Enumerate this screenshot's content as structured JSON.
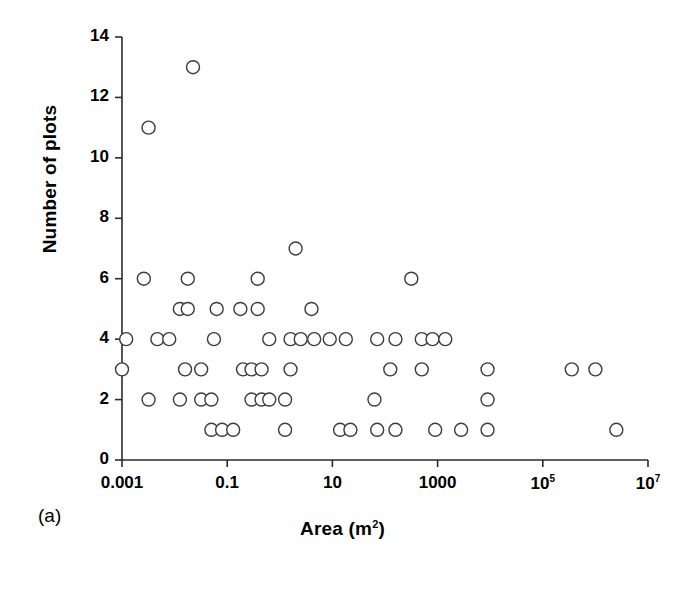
{
  "panel": {
    "caption": "(a)"
  },
  "chart_data": {
    "type": "scatter",
    "title": "",
    "xlabel": "Area (m²)",
    "xlabel_base": "Area (m",
    "xlabel_sup": "2",
    "xlabel_tail": ")",
    "ylabel": "Number of plots",
    "xscale": "log",
    "yscale": "linear",
    "xlim": [
      0.001,
      10000000
    ],
    "ylim": [
      0,
      14
    ],
    "grid": false,
    "legend": null,
    "marker": {
      "shape": "circle",
      "facecolor": "#ffffff",
      "edgecolor": "#3c3c3c",
      "size_px": 13,
      "linewidth_px": 1.4
    },
    "xticks": [
      {
        "value": 0.001,
        "label": "0.001",
        "sup": ""
      },
      {
        "value": 0.1,
        "label": "0.1",
        "sup": ""
      },
      {
        "value": 10,
        "label": "10",
        "sup": ""
      },
      {
        "value": 1000,
        "label": "1000",
        "sup": ""
      },
      {
        "value": 100000,
        "label": "10",
        "sup": "5"
      },
      {
        "value": 10000000,
        "label": "10",
        "sup": "7"
      }
    ],
    "yticks": [
      {
        "value": 0,
        "label": "0"
      },
      {
        "value": 2,
        "label": "2"
      },
      {
        "value": 4,
        "label": "4"
      },
      {
        "value": 6,
        "label": "6"
      },
      {
        "value": 8,
        "label": "8"
      },
      {
        "value": 10,
        "label": "10"
      },
      {
        "value": 12,
        "label": "12"
      },
      {
        "value": 14,
        "label": "14"
      }
    ],
    "points": [
      {
        "x": 0.0224,
        "y": 13
      },
      {
        "x": 0.0032,
        "y": 11
      },
      {
        "x": 2.0,
        "y": 7
      },
      {
        "x": 0.0026,
        "y": 6
      },
      {
        "x": 0.0178,
        "y": 6
      },
      {
        "x": 0.38,
        "y": 6
      },
      {
        "x": 316.0,
        "y": 6
      },
      {
        "x": 0.0126,
        "y": 5
      },
      {
        "x": 0.0178,
        "y": 5
      },
      {
        "x": 0.063,
        "y": 5
      },
      {
        "x": 0.178,
        "y": 5
      },
      {
        "x": 0.38,
        "y": 5
      },
      {
        "x": 4.0,
        "y": 5
      },
      {
        "x": 0.0012,
        "y": 4
      },
      {
        "x": 0.0047,
        "y": 4
      },
      {
        "x": 0.0079,
        "y": 4
      },
      {
        "x": 0.056,
        "y": 4
      },
      {
        "x": 0.63,
        "y": 4
      },
      {
        "x": 1.6,
        "y": 4
      },
      {
        "x": 2.5,
        "y": 4
      },
      {
        "x": 4.5,
        "y": 4
      },
      {
        "x": 8.9,
        "y": 4
      },
      {
        "x": 18.0,
        "y": 4
      },
      {
        "x": 71.0,
        "y": 4
      },
      {
        "x": 158.0,
        "y": 4
      },
      {
        "x": 500.0,
        "y": 4
      },
      {
        "x": 800.0,
        "y": 4
      },
      {
        "x": 1400.0,
        "y": 4
      },
      {
        "x": 0.001,
        "y": 3
      },
      {
        "x": 0.0158,
        "y": 3
      },
      {
        "x": 0.032,
        "y": 3
      },
      {
        "x": 0.2,
        "y": 3
      },
      {
        "x": 0.29,
        "y": 3
      },
      {
        "x": 0.45,
        "y": 3
      },
      {
        "x": 1.6,
        "y": 3
      },
      {
        "x": 126.0,
        "y": 3
      },
      {
        "x": 500.0,
        "y": 3
      },
      {
        "x": 8900.0,
        "y": 3
      },
      {
        "x": 355000.0,
        "y": 3
      },
      {
        "x": 1000000.0,
        "y": 3
      },
      {
        "x": 0.0032,
        "y": 2
      },
      {
        "x": 0.0126,
        "y": 2
      },
      {
        "x": 0.032,
        "y": 2
      },
      {
        "x": 0.05,
        "y": 2
      },
      {
        "x": 0.29,
        "y": 2
      },
      {
        "x": 0.45,
        "y": 2
      },
      {
        "x": 0.63,
        "y": 2
      },
      {
        "x": 1.26,
        "y": 2
      },
      {
        "x": 63.0,
        "y": 2
      },
      {
        "x": 8900.0,
        "y": 2
      },
      {
        "x": 0.05,
        "y": 1
      },
      {
        "x": 0.08,
        "y": 1
      },
      {
        "x": 0.13,
        "y": 1
      },
      {
        "x": 1.26,
        "y": 1
      },
      {
        "x": 14.0,
        "y": 1
      },
      {
        "x": 22.0,
        "y": 1
      },
      {
        "x": 71.0,
        "y": 1
      },
      {
        "x": 158.0,
        "y": 1
      },
      {
        "x": 900.0,
        "y": 1
      },
      {
        "x": 2800.0,
        "y": 1
      },
      {
        "x": 8900.0,
        "y": 1
      },
      {
        "x": 2500000.0,
        "y": 1
      }
    ],
    "axis": {
      "color": "#2b2b2b",
      "linewidth_px": 1.6,
      "tick_length_px": 7
    }
  }
}
